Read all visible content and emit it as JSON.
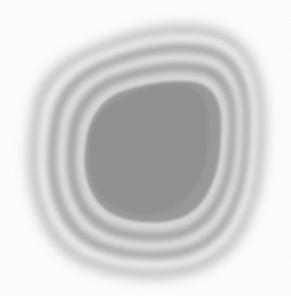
{
  "image": {
    "description": "Grayscale blob with concentric contour rings around a darker uniform core",
    "background": "#ffffff",
    "core_color": "#8c8c8c",
    "ring_dark": "#9a9a9a",
    "ring_light": "#e6e6e6",
    "halo_color": "#bdbdbd"
  }
}
